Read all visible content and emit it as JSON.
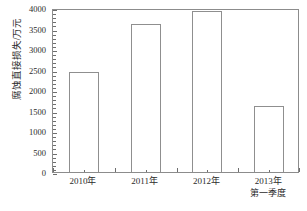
{
  "chart_data": {
    "type": "bar",
    "title": "",
    "xlabel": "",
    "ylabel": "腐蚀直接损失/万元",
    "categories": [
      "2010年",
      "2011年",
      "2012年",
      "2013年"
    ],
    "category_sublabels": [
      "",
      "",
      "",
      "第一季度"
    ],
    "values": [
      2450,
      3620,
      3920,
      1610
    ],
    "ylim": [
      0,
      4000
    ],
    "ytick_labels": [
      "0",
      "500",
      "1000",
      "1500",
      "2000",
      "2500",
      "3000",
      "3500",
      "4000"
    ],
    "ytick_values": [
      0,
      500,
      1000,
      1500,
      2000,
      2500,
      3000,
      3500,
      4000
    ],
    "yminor_step": 100,
    "grid": false,
    "legend": "none",
    "bar_fill_color": "#ffffff",
    "bar_edge_color": "#8f8f8f",
    "axis_color": "#8c8c8c",
    "text_color": "#2b2b2b"
  }
}
